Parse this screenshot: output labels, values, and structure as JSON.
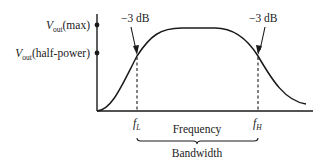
{
  "diagram": {
    "type": "frequency-response",
    "colors": {
      "stroke": "#1a1a1a",
      "background": "#ffffff"
    },
    "y_axis": {
      "levels": [
        {
          "symbol": "V",
          "subscript": "out",
          "suffix": "(max)",
          "id": "max"
        },
        {
          "symbol": "V",
          "subscript": "out",
          "suffix": "(half-power)",
          "id": "half-power"
        }
      ]
    },
    "x_axis": {
      "label": "Frequency",
      "markers": [
        {
          "symbol": "f",
          "subscript": "L",
          "id": "low-cutoff"
        },
        {
          "symbol": "f",
          "subscript": "H",
          "id": "high-cutoff"
        }
      ]
    },
    "annotations": {
      "left_point": "−3 dB",
      "right_point": "−3 dB"
    },
    "bandwidth_label": "Bandwidth"
  }
}
